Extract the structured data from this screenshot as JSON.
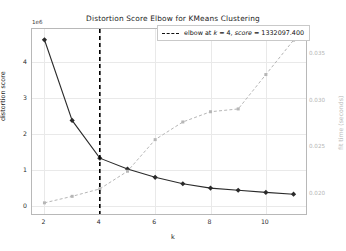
{
  "chart_data": {
    "type": "line",
    "title": "Distortion Score Elbow for KMeans Clustering",
    "xlabel": "k",
    "ylabel": "distortion score",
    "ylabel_right": "fit time (seconds)",
    "y_offset_text": "1e6",
    "grid": true,
    "legend_position": "upper right",
    "x": [
      2,
      3,
      4,
      5,
      6,
      7,
      8,
      9,
      10,
      11
    ],
    "xlim": [
      1.55,
      11.45
    ],
    "xticks": [
      2,
      4,
      6,
      8,
      10
    ],
    "xticklabels": [
      "2",
      "4",
      "6",
      "8",
      "10"
    ],
    "ylim": [
      -0.22,
      4.92
    ],
    "yticks": [
      0,
      1,
      2,
      3,
      4
    ],
    "yticklabels": [
      "0",
      "1",
      "2",
      "3",
      "4"
    ],
    "ylim_right": [
      0.0178,
      0.0377
    ],
    "yticks_right": [
      0.02,
      0.025,
      0.03,
      0.035
    ],
    "yticklabels_right": [
      "0.020",
      "0.025",
      "0.030",
      "0.035"
    ],
    "series": [
      {
        "name": "distortion score",
        "axis": "left",
        "style": "solid",
        "color": "#2b2b2b",
        "marker": "diamond",
        "values": [
          4.62,
          2.38,
          1.332,
          1.03,
          0.8,
          0.62,
          0.5,
          0.44,
          0.38,
          0.33
        ]
      },
      {
        "name": "fit time (seconds)",
        "axis": "right",
        "style": "dashed",
        "color": "#b6b6b6",
        "marker": "square",
        "values": [
          0.019,
          0.0197,
          0.0205,
          0.0224,
          0.0258,
          0.0277,
          0.0288,
          0.0291,
          0.0328,
          0.0365
        ]
      }
    ],
    "annotations": [
      {
        "name": "elbow-vline",
        "type": "vline",
        "x": 4,
        "style": "dashed",
        "color": "#000000"
      }
    ]
  },
  "legend": {
    "elbow_prefix": "elbow at ",
    "k_symbol": "k",
    "k_equals": " = 4, ",
    "score_symbol": "score",
    "score_equals": " = 1332097.400"
  }
}
